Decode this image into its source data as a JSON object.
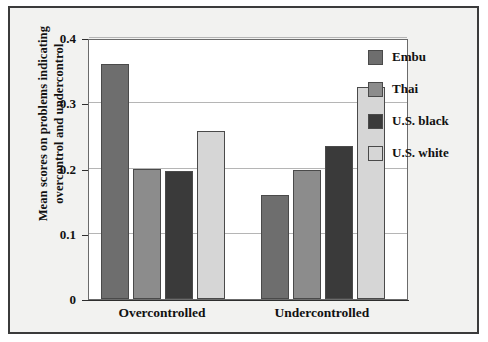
{
  "chart_data": {
    "type": "bar",
    "title": "",
    "subtitle": "",
    "xlabel": "",
    "ylabel": "Mean scores on problems indicating overcontrol and undercontrol",
    "ylabel_lines": [
      "Mean scores on problems indicating",
      "overcontrol and undercontrol"
    ],
    "categories": [
      "Overcontrolled",
      "Undercontrolled"
    ],
    "series": [
      {
        "name": "Embu",
        "values": [
          0.36,
          0.16
        ],
        "color": "#6e6e6e"
      },
      {
        "name": "Thai",
        "values": [
          0.2,
          0.197
        ],
        "color": "#8c8c8c"
      },
      {
        "name": "U.S. black",
        "values": [
          0.196,
          0.234
        ],
        "color": "#3a3a3a"
      },
      {
        "name": "U.S. white",
        "values": [
          0.257,
          0.325
        ],
        "color": "#d6d6d6"
      }
    ],
    "ylim": [
      0,
      0.4
    ],
    "yticks": [
      0,
      0.1,
      0.2,
      0.3,
      0.4
    ],
    "ytick_labels": [
      "0",
      "0.1",
      "0.2",
      "0.3",
      "0.4"
    ],
    "grid": true,
    "grid_axis": "y",
    "legend_position": "right",
    "bar_border_color": "#4a4a4a",
    "axis_color": "#2e2e2e",
    "gridline_color": "#b5b5b5",
    "plot_background": "#ffffff",
    "figure_background": "#f2f2f0"
  }
}
